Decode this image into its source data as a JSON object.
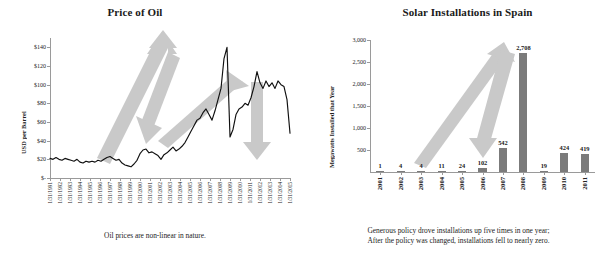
{
  "chart_data": [
    {
      "type": "line",
      "title": "Price of Oil",
      "xlabel": "",
      "ylabel": "USD per Barrel",
      "caption": "Oil prices are non-linear in nature.",
      "ylim": [
        0,
        150
      ],
      "yticks": [
        "$-",
        "$20",
        "$40",
        "$60",
        "$80",
        "$100",
        "$120",
        "$140"
      ],
      "ytick_values": [
        0,
        20,
        40,
        60,
        80,
        100,
        120,
        140
      ],
      "grid": false,
      "legend": "none",
      "xtick_labels": [
        "1/31/1991",
        "1/31/1992",
        "1/31/1993",
        "1/31/1994",
        "1/31/1995",
        "1/31/1996",
        "1/31/1997",
        "1/31/1998",
        "1/31/1999",
        "1/31/2000",
        "1/31/2001",
        "1/31/2002",
        "1/31/2003",
        "1/31/2004",
        "1/31/2005",
        "1/31/2006",
        "1/31/2007",
        "1/31/2008",
        "1/31/2009",
        "1/31/2010",
        "1/31/2011",
        "1/31/2012",
        "1/31/2013",
        "1/31/2014",
        "1/31/2015"
      ],
      "x": [
        1991.0,
        1991.3,
        1991.6,
        1991.9,
        1992.2,
        1992.5,
        1992.8,
        1993.1,
        1993.4,
        1993.7,
        1994.0,
        1994.3,
        1994.6,
        1994.9,
        1995.2,
        1995.5,
        1995.8,
        1996.1,
        1996.4,
        1996.7,
        1997.0,
        1997.3,
        1997.6,
        1997.9,
        1998.2,
        1998.5,
        1998.8,
        1999.1,
        1999.4,
        1999.7,
        2000.0,
        2000.3,
        2000.6,
        2000.9,
        2001.2,
        2001.5,
        2001.8,
        2002.1,
        2002.4,
        2002.7,
        2003.0,
        2003.3,
        2003.6,
        2003.9,
        2004.2,
        2004.5,
        2004.8,
        2005.1,
        2005.4,
        2005.7,
        2006.0,
        2006.3,
        2006.6,
        2006.9,
        2007.2,
        2007.5,
        2007.8,
        2008.1,
        2008.4,
        2008.7,
        2009.0,
        2009.3,
        2009.6,
        2009.9,
        2010.2,
        2010.5,
        2010.8,
        2011.1,
        2011.4,
        2011.7,
        2012.0,
        2012.3,
        2012.6,
        2012.9,
        2013.2,
        2013.5,
        2013.8,
        2014.1,
        2014.4,
        2014.7,
        2015.0
      ],
      "values": [
        21,
        20,
        22,
        20,
        19,
        21,
        20,
        19,
        18,
        20,
        17,
        16,
        18,
        17,
        18,
        17,
        19,
        18,
        20,
        22,
        23,
        21,
        19,
        20,
        16,
        14,
        13,
        12,
        15,
        19,
        26,
        30,
        31,
        27,
        28,
        26,
        24,
        20,
        25,
        27,
        30,
        33,
        29,
        31,
        34,
        38,
        44,
        50,
        56,
        62,
        64,
        70,
        74,
        68,
        62,
        72,
        84,
        96,
        128,
        140,
        44,
        52,
        68,
        74,
        76,
        80,
        78,
        86,
        98,
        114,
        102,
        96,
        104,
        98,
        102,
        96,
        104,
        100,
        98,
        84,
        48
      ],
      "annotations": [
        {
          "name": "up-arrow-2003-2008",
          "direction": "up"
        },
        {
          "name": "down-arrow-2008-2009",
          "direction": "down"
        },
        {
          "name": "up-arrow-2009-2013",
          "direction": "up"
        },
        {
          "name": "down-arrow-2014-2015",
          "direction": "down"
        }
      ]
    },
    {
      "type": "bar",
      "title": "Solar Installations in Spain",
      "xlabel": "",
      "ylabel": "Megawatts Installed that Year",
      "caption_line1": "Generous policy drove installations up five times in one year;",
      "caption_line2": "After the policy was changed, installations fell to nearly zero.",
      "ylim": [
        0,
        3000
      ],
      "yticks": [
        "500",
        "1,000",
        "1,500",
        "2,000",
        "2,500",
        "3,000"
      ],
      "ytick_values": [
        500,
        1000,
        1500,
        2000,
        2500,
        3000
      ],
      "grid": false,
      "legend": "none",
      "categories": [
        "2001",
        "2002",
        "2003",
        "2004",
        "2005",
        "2006",
        "2007",
        "2008",
        "2009",
        "2010",
        "2011"
      ],
      "values": [
        1,
        4,
        4,
        11,
        24,
        102,
        542,
        2708,
        19,
        424,
        419
      ],
      "value_labels": [
        "1",
        "4",
        "4",
        "11",
        "24",
        "102",
        "542",
        "2,708",
        "19",
        "424",
        "419"
      ],
      "annotations": [
        {
          "name": "up-arrow-2006-2008",
          "direction": "up"
        },
        {
          "name": "down-arrow-2008-2009",
          "direction": "down"
        }
      ]
    }
  ],
  "colors": {
    "bar": "#7b7b7b",
    "arrow": "#c9c9c9",
    "line": "#101010",
    "axis": "#9a9a9a",
    "text": "#1a1a1a",
    "background": "#ffffff"
  }
}
